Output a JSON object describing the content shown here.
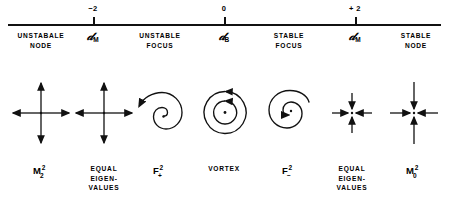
{
  "figure": {
    "kind": "phase-portrait-classification-number-line",
    "ink_color": "#111111",
    "background": "#ffffff"
  },
  "axis": {
    "name": "parameter-axis",
    "ticks": [
      {
        "id": "tick-minus-2",
        "value": "−2",
        "symbol_base": "𝒹",
        "symbol_sub": "M",
        "x": 93
      },
      {
        "id": "tick-zero",
        "value": "0",
        "symbol_base": "𝒹",
        "symbol_sub": "B",
        "x": 224
      },
      {
        "id": "tick-plus-2",
        "value": "+ 2",
        "symbol_base": "𝒹",
        "symbol_sub": "M",
        "x": 355
      }
    ]
  },
  "regions": [
    {
      "id": "region-unstable-node",
      "heading": "UNSTABALE\nNODE",
      "heading_line1": "UNSTABALE",
      "heading_line2": "NODE",
      "portrait": "outward-star-node",
      "caption_kind": "math",
      "caption_base": "M",
      "caption_sup": "2",
      "caption_sub": "2",
      "center_x": 41
    },
    {
      "id": "region-equal-eigenvalues-left",
      "heading_line1": "",
      "heading_line2": "",
      "portrait": "outward-star-node",
      "caption_kind": "text",
      "caption_line1": "EQUAL",
      "caption_line2": "EIGEN-",
      "caption_line3": "VALUES",
      "center_x": 104
    },
    {
      "id": "region-unstable-focus",
      "heading_line1": "UNSTABLE",
      "heading_line2": "FOCUS",
      "portrait": "outward-spiral",
      "caption_kind": "math",
      "caption_base": "F",
      "caption_sup": "2",
      "caption_sub": "+",
      "center_x": 160
    },
    {
      "id": "region-vortex",
      "heading_line1": "",
      "heading_line2": "",
      "portrait": "vortex-concentric-circles",
      "caption_kind": "text",
      "caption_line1": "VORTEX",
      "caption_line2": "",
      "caption_line3": "",
      "center_x": 224
    },
    {
      "id": "region-stable-focus",
      "heading_line1": "STABLE",
      "heading_line2": "FOCUS",
      "portrait": "inward-spiral",
      "caption_kind": "math",
      "caption_base": "F",
      "caption_sup": "2",
      "caption_sub": "−",
      "center_x": 289
    },
    {
      "id": "region-equal-eigenvalues-right",
      "heading_line1": "",
      "heading_line2": "",
      "portrait": "inward-star-node-small",
      "caption_kind": "text",
      "caption_line1": "EQUAL",
      "caption_line2": "EIGEN-",
      "caption_line3": "VALUES",
      "center_x": 352
    },
    {
      "id": "region-stable-node",
      "heading_line1": "STABLE",
      "heading_line2": "NODE",
      "portrait": "inward-star-node-large",
      "caption_kind": "math",
      "caption_base": "M",
      "caption_sup": "2",
      "caption_sub": "0",
      "center_x": 414
    }
  ],
  "headings": {
    "unstable_node_l1": "UNSTABALE",
    "unstable_node_l2": "NODE",
    "unstable_focus_l1": "UNSTABLE",
    "unstable_focus_l2": "FOCUS",
    "stable_focus_l1": "STABLE",
    "stable_focus_l2": "FOCUS",
    "stable_node_l1": "STABLE",
    "stable_node_l2": "NODE"
  },
  "captions": {
    "equal_l1": "EQUAL",
    "equal_l2": "EIGEN-",
    "equal_l3": "VALUES",
    "vortex": "VORTEX"
  }
}
